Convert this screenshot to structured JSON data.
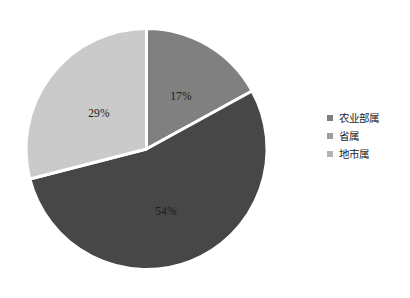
{
  "chart_data": {
    "type": "pie",
    "title": "",
    "subtitle": "",
    "xlabel": "",
    "ylabel": "",
    "grid": false,
    "legend_position": "right",
    "start_angle_deg": 0,
    "direction": "clockwise",
    "categories": [
      "农业部属",
      "省属",
      "地市属"
    ],
    "values": [
      17,
      54,
      29
    ],
    "labels": [
      "17%",
      "54%",
      "29%"
    ],
    "colors": [
      "#808080",
      "#474747",
      "#cacaca"
    ],
    "separator_color": "#ffffff",
    "slices": [
      {
        "name": "农业部属",
        "value": 17,
        "label": "17%",
        "color": "#808080",
        "start_deg": 0,
        "end_deg": 61.2,
        "label_x": 181,
        "label_y": 97
      },
      {
        "name": "省属",
        "value": 54,
        "label": "54%",
        "color": "#474747",
        "start_deg": 61.2,
        "end_deg": 255.6,
        "label_x": 166,
        "label_y": 212
      },
      {
        "name": "地市属",
        "value": 29,
        "label": "29%",
        "color": "#cacaca",
        "start_deg": 255.6,
        "end_deg": 360,
        "label_x": 99,
        "label_y": 114
      }
    ]
  },
  "legend": {
    "items": [
      {
        "label": "农业部属",
        "color": "#808080"
      },
      {
        "label": "省属",
        "color": "#9d9d9d"
      },
      {
        "label": "地市属",
        "color": "#b4b4b4"
      }
    ]
  }
}
